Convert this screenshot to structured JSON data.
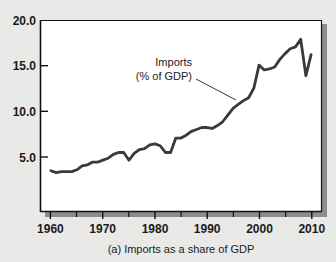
{
  "chart_data": {
    "type": "line",
    "title": "",
    "caption": "(a) Imports as a share of GDP",
    "xlabel": "",
    "ylabel": "",
    "xlim": [
      1958,
      2012
    ],
    "ylim": [
      0.0,
      20.0
    ],
    "grid": false,
    "legend_position": "inline-annotation",
    "series_color": "#3a3a3a",
    "plot_background": "#ffffff",
    "page_background": "#e9e9e7",
    "frame_color": "#111111",
    "x_ticks": [
      1960,
      1970,
      1980,
      1990,
      2000,
      2010
    ],
    "x_tick_labels": [
      "1960",
      "1970",
      "1980",
      "1990",
      "2000",
      "2010"
    ],
    "x_minor_ticks": [
      1965,
      1975,
      1985,
      1995,
      2005
    ],
    "y_ticks": [
      5.0,
      10.0,
      15.0,
      20.0
    ],
    "y_tick_labels": [
      "5.0",
      "10.0",
      "15.0",
      "20.0"
    ],
    "annotations": [
      {
        "name": "imports-annotation",
        "line1": "Imports",
        "line2": "(% of GDP)",
        "points_to_x": 1995,
        "points_to_y": 11.6
      }
    ],
    "series": [
      {
        "name": "Imports (% of GDP)",
        "x": [
          1960,
          1961,
          1962,
          1963,
          1964,
          1965,
          1966,
          1967,
          1968,
          1969,
          1970,
          1971,
          1972,
          1973,
          1974,
          1975,
          1976,
          1977,
          1978,
          1979,
          1980,
          1981,
          1982,
          1983,
          1984,
          1985,
          1986,
          1987,
          1988,
          1989,
          1990,
          1991,
          1992,
          1993,
          1994,
          1995,
          1996,
          1997,
          1998,
          1999,
          2000,
          2001,
          2002,
          2003,
          2004,
          2005,
          2006,
          2007,
          2008,
          2009,
          2010
        ],
        "values": [
          4.3,
          4.1,
          4.2,
          4.2,
          4.2,
          4.4,
          4.8,
          4.9,
          5.2,
          5.2,
          5.4,
          5.6,
          6.0,
          6.2,
          6.2,
          5.4,
          6.1,
          6.5,
          6.6,
          7.0,
          7.1,
          6.9,
          6.2,
          6.2,
          7.7,
          7.7,
          8.0,
          8.4,
          8.6,
          8.8,
          8.8,
          8.7,
          9.0,
          9.4,
          10.1,
          10.8,
          11.2,
          11.6,
          11.9,
          12.9,
          15.3,
          14.8,
          14.9,
          15.1,
          15.9,
          16.5,
          17.0,
          17.2,
          18.0,
          14.2,
          16.4
        ]
      }
    ]
  },
  "caption": {
    "text": "(a) Imports as a share of GDP"
  }
}
